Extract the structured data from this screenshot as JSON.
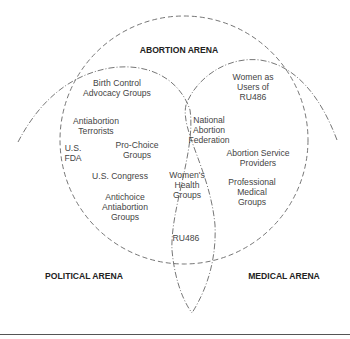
{
  "arenas": {
    "abortion": "ABORTION ARENA",
    "political": "POLITICAL ARENA",
    "medical": "MEDICAL ARENA"
  },
  "actors": {
    "birth_control": "Birth Control\nAdvocacy Groups",
    "antiabortion_terrorists": "Antiabortion\nTerrorists",
    "us_fda": "U.S.\nFDA",
    "pro_choice": "Pro-Choice\nGroups",
    "us_congress": "U.S. Congress",
    "antichoice": "Antichoice\nAntiabortion\nGroups",
    "naf": "National\nAbortion\nFederation",
    "womens_health": "Women's\nHealth\nGroups",
    "ru486": "RU486",
    "women_users": "Women as\nUsers of\nRU486",
    "abortion_service": "Abortion Service\nProviders",
    "professional_medical": "Professional\nMedical\nGroups"
  },
  "colors": {
    "line": "#555555",
    "text": "#444444",
    "heading": "#222222"
  }
}
